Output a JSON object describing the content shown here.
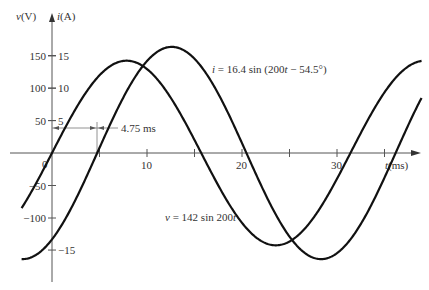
{
  "chart_data": {
    "type": "line",
    "title": "",
    "xlabel": "t(ms)",
    "ylabel_left": "v(V)",
    "ylabel_right": "i(A)",
    "x_ticks": [
      {
        "value": 0,
        "label": "0"
      },
      {
        "value": 5,
        "label": ""
      },
      {
        "value": 10,
        "label": "10"
      },
      {
        "value": 15,
        "label": ""
      },
      {
        "value": 20,
        "label": "20"
      },
      {
        "value": 25,
        "label": ""
      },
      {
        "value": 30,
        "label": "30"
      },
      {
        "value": 35,
        "label": ""
      }
    ],
    "y_ticks_voltage": [
      {
        "value": 150,
        "label": "150"
      },
      {
        "value": 100,
        "label": "100"
      },
      {
        "value": 50,
        "label": "50"
      },
      {
        "value": -50,
        "label": "−50"
      },
      {
        "value": -100,
        "label": "−100"
      }
    ],
    "y_ticks_current": [
      {
        "value": 15,
        "label": "15"
      },
      {
        "value": 10,
        "label": "10"
      },
      {
        "value": 5,
        "label": "5"
      },
      {
        "value": -15,
        "label": "−15"
      }
    ],
    "xlim": [
      -3.2,
      38.9
    ],
    "series": [
      {
        "name": "v",
        "equation": "v = 142 sin 200t",
        "amplitude": 142,
        "omega": 200,
        "phase_deg": 0,
        "units": "V"
      },
      {
        "name": "i",
        "equation": "i = 16.4 sin (200t − 54.5°)",
        "amplitude": 16.4,
        "omega": 200,
        "phase_deg": -54.5,
        "units": "A"
      }
    ],
    "annotations": [
      {
        "text": "4.75 ms",
        "type": "dimension",
        "from_ms": 0,
        "to_ms": 4.75
      }
    ],
    "grid": false
  },
  "labels": {
    "v_axis": "v(V)",
    "i_axis": "i(A)",
    "t_axis": "t(ms)",
    "origin": "0",
    "delay": "4.75 ms",
    "i_eq": "i = 16.4 sin (200t − 54.5°)",
    "v_eq": "v = 142 sin 200t"
  }
}
